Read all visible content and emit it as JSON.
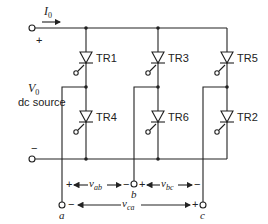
{
  "diagram": {
    "type": "three-phase thyristor bridge inverter",
    "source": {
      "current_label": "I",
      "current_sub": "0",
      "voltage_label": "V",
      "voltage_sub": "0",
      "source_caption": "dc source",
      "plus": "+",
      "minus": "−"
    },
    "thyristors": {
      "upper": [
        "TR1",
        "TR3",
        "TR5"
      ],
      "lower": [
        "TR4",
        "TR6",
        "TR2"
      ]
    },
    "terminals": [
      "a",
      "b",
      "c"
    ],
    "voltages": {
      "vab": {
        "sym": "v",
        "sub": "ab",
        "plus": "+",
        "minus": "−"
      },
      "vbc": {
        "sym": "v",
        "sub": "bc",
        "plus": "+",
        "minus": "−"
      },
      "vca": {
        "sym": "v",
        "sub": "ca",
        "plus": "+",
        "minus": "−"
      }
    },
    "colors": {
      "line": "#222222",
      "background": "#ffffff"
    }
  }
}
